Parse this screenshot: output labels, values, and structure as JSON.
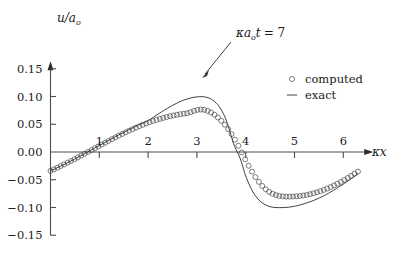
{
  "chart_data": {
    "type": "line",
    "title": "",
    "xlabel": "κx",
    "ylabel": "u/aₒ",
    "ylabel_main": "u/a",
    "ylabel_sub": "o",
    "xlabel_main": "κx",
    "xlim": [
      0,
      6.45
    ],
    "ylim": [
      -0.15,
      0.16
    ],
    "grid": false,
    "x_ticks": [
      1,
      2,
      3,
      4,
      5,
      6
    ],
    "x_tick_labels": [
      "1",
      "2",
      "3",
      "4",
      "5",
      "6"
    ],
    "y_ticks": [
      0.15,
      0.1,
      0.05,
      0.0,
      -0.05,
      -0.1,
      -0.15
    ],
    "y_tick_labels": [
      "0.15",
      "0.10",
      "0.05",
      "0.00",
      "−0.05",
      "−0.10",
      "−0.15"
    ],
    "annotation": {
      "text_kappa": "κ",
      "text_a": "a",
      "text_sub": "o",
      "text_t": "t",
      "text_eq": "= 7",
      "full_text": "κaₒt = 7",
      "points_to_x": 3.05,
      "points_to_y": 0.098
    },
    "legend": {
      "position": "upper-right",
      "entries": [
        {
          "name": "computed",
          "marker": "open-circle",
          "label": "computed"
        },
        {
          "name": "exact",
          "marker": "line",
          "label": "exact"
        }
      ]
    },
    "series": [
      {
        "name": "exact",
        "style": "line",
        "x": [
          0.0,
          0.1,
          0.2,
          0.3,
          0.4,
          0.5,
          0.6,
          0.7,
          0.8,
          0.9,
          1.0,
          1.1,
          1.2,
          1.3,
          1.4,
          1.5,
          1.6,
          1.7,
          1.8,
          1.9,
          2.0,
          2.1,
          2.2,
          2.3,
          2.4,
          2.5,
          2.6,
          2.7,
          2.8,
          2.9,
          3.0,
          3.1,
          3.2,
          3.3,
          3.4,
          3.5,
          3.6,
          3.7,
          3.75,
          3.8,
          3.85,
          3.9,
          3.95,
          4.0,
          4.1,
          4.2,
          4.3,
          4.4,
          4.5,
          4.6,
          4.7,
          4.8,
          4.9,
          5.0,
          5.1,
          5.2,
          5.3,
          5.4,
          5.5,
          5.6,
          5.7,
          5.8,
          5.9,
          6.0,
          6.1,
          6.2,
          6.3
        ],
        "y": [
          -0.034,
          -0.03,
          -0.0258,
          -0.0215,
          -0.017,
          -0.0124,
          -0.0077,
          -0.0029,
          0.0019,
          0.0068,
          0.0117,
          0.0166,
          0.0214,
          0.0262,
          0.0309,
          0.0355,
          0.04,
          0.0443,
          0.0485,
          0.0525,
          0.0563,
          0.0623,
          0.068,
          0.0735,
          0.079,
          0.084,
          0.0885,
          0.0925,
          0.0955,
          0.098,
          0.0993,
          0.0998,
          0.0985,
          0.095,
          0.088,
          0.076,
          0.0575,
          0.03,
          0.015,
          0.005,
          -0.004,
          -0.015,
          -0.029,
          -0.043,
          -0.064,
          -0.079,
          -0.089,
          -0.095,
          -0.0985,
          -0.1,
          -0.1003,
          -0.1,
          -0.0992,
          -0.0978,
          -0.0958,
          -0.0932,
          -0.0903,
          -0.087,
          -0.0832,
          -0.079,
          -0.0742,
          -0.069,
          -0.0635,
          -0.0578,
          -0.0518,
          -0.0455,
          -0.039
        ]
      },
      {
        "name": "computed",
        "style": "open-circles",
        "x": [
          0.0,
          0.07,
          0.14,
          0.21,
          0.28,
          0.35,
          0.42,
          0.49,
          0.56,
          0.63,
          0.7,
          0.77,
          0.84,
          0.91,
          0.98,
          1.05,
          1.12,
          1.19,
          1.26,
          1.33,
          1.4,
          1.47,
          1.54,
          1.61,
          1.68,
          1.75,
          1.82,
          1.89,
          1.96,
          2.03,
          2.1,
          2.17,
          2.24,
          2.31,
          2.38,
          2.45,
          2.52,
          2.59,
          2.66,
          2.73,
          2.8,
          2.87,
          2.94,
          3.01,
          3.08,
          3.15,
          3.22,
          3.29,
          3.36,
          3.43,
          3.5,
          3.57,
          3.64,
          3.71,
          3.78,
          3.85,
          3.92,
          3.99,
          4.06,
          4.13,
          4.2,
          4.27,
          4.34,
          4.41,
          4.48,
          4.55,
          4.62,
          4.69,
          4.76,
          4.83,
          4.9,
          4.97,
          5.04,
          5.11,
          5.18,
          5.25,
          5.32,
          5.39,
          5.46,
          5.53,
          5.6,
          5.67,
          5.74,
          5.81,
          5.88,
          5.95,
          6.02,
          6.09,
          6.16,
          6.23,
          6.3
        ],
        "y": [
          -0.034,
          -0.0312,
          -0.0283,
          -0.0253,
          -0.0223,
          -0.0192,
          -0.0161,
          -0.0129,
          -0.0097,
          -0.0064,
          -0.0031,
          0.0002,
          0.0035,
          0.0068,
          0.0101,
          0.0134,
          0.0167,
          0.02,
          0.0232,
          0.0264,
          0.0295,
          0.0325,
          0.0355,
          0.0384,
          0.0412,
          0.0439,
          0.0465,
          0.049,
          0.0514,
          0.0537,
          0.0558,
          0.0578,
          0.0597,
          0.0614,
          0.063,
          0.0645,
          0.0658,
          0.067,
          0.0681,
          0.069,
          0.0698,
          0.0716,
          0.074,
          0.0758,
          0.0765,
          0.076,
          0.0742,
          0.0712,
          0.0672,
          0.0622,
          0.0562,
          0.0492,
          0.0412,
          0.0322,
          0.0222,
          0.0112,
          -0.0008,
          -0.013,
          -0.0248,
          -0.0355,
          -0.0452,
          -0.0538,
          -0.0612,
          -0.0672,
          -0.0718,
          -0.0752,
          -0.0776,
          -0.0791,
          -0.0799,
          -0.0803,
          -0.0804,
          -0.0802,
          -0.0798,
          -0.0792,
          -0.0784,
          -0.0773,
          -0.076,
          -0.0744,
          -0.0726,
          -0.0706,
          -0.0683,
          -0.0658,
          -0.0631,
          -0.0602,
          -0.0571,
          -0.0538,
          -0.0503,
          -0.0467,
          -0.043,
          -0.0392,
          -0.0353
        ]
      }
    ]
  }
}
